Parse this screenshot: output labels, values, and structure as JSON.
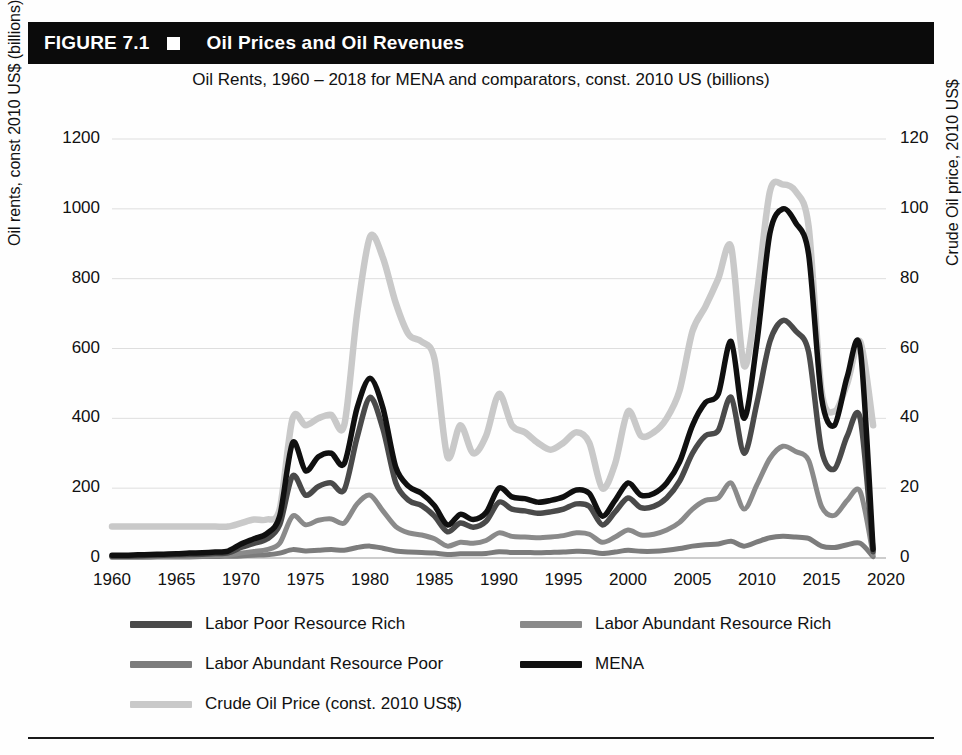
{
  "figure": {
    "number": "FIGURE 7.1",
    "title": "Oil Prices and Oil Revenues",
    "bar_color": "#0b0b0b",
    "marker_icon": "filled-square-icon"
  },
  "chart_data": {
    "type": "line",
    "title": "Oil Rents, 1960 – 2018 for MENA and comparators, const. 2010 US (billions)",
    "xlabel": "",
    "ylabel": "Oil rents, const 2010 US$ (billions)",
    "y2label": "Crude Oil price, 2010 US$",
    "xlim": [
      1960,
      2020
    ],
    "ylim": [
      0,
      1200
    ],
    "y2lim": [
      0,
      120
    ],
    "xticks": [
      1960,
      1965,
      1970,
      1975,
      1980,
      1985,
      1990,
      1995,
      2000,
      2005,
      2010,
      2015,
      2020
    ],
    "yticks": [
      0,
      200,
      400,
      600,
      800,
      1000,
      1200
    ],
    "y2ticks": [
      0,
      20,
      40,
      60,
      80,
      100,
      120
    ],
    "grid": true,
    "legend_position": "bottom",
    "x": [
      1960,
      1961,
      1962,
      1963,
      1964,
      1965,
      1966,
      1967,
      1968,
      1969,
      1970,
      1971,
      1972,
      1973,
      1974,
      1975,
      1976,
      1977,
      1978,
      1979,
      1980,
      1981,
      1982,
      1983,
      1984,
      1985,
      1986,
      1987,
      1988,
      1989,
      1990,
      1991,
      1992,
      1993,
      1994,
      1995,
      1996,
      1997,
      1998,
      1999,
      2000,
      2001,
      2002,
      2003,
      2004,
      2005,
      2006,
      2007,
      2008,
      2009,
      2010,
      2011,
      2012,
      2013,
      2014,
      2015,
      2016,
      2017,
      2018,
      2019
    ],
    "series": [
      {
        "name": "MENA",
        "axis": "left",
        "color": "#101010",
        "values": [
          8,
          8,
          9,
          10,
          11,
          12,
          14,
          15,
          17,
          20,
          40,
          55,
          70,
          120,
          330,
          250,
          290,
          300,
          270,
          430,
          515,
          430,
          260,
          205,
          185,
          150,
          95,
          125,
          110,
          130,
          200,
          175,
          170,
          160,
          165,
          175,
          195,
          185,
          120,
          165,
          215,
          180,
          185,
          215,
          275,
          380,
          445,
          470,
          620,
          400,
          620,
          930,
          1000,
          960,
          870,
          460,
          380,
          520,
          600,
          25
        ]
      },
      {
        "name": "Labor Poor Resource Rich",
        "axis": "left",
        "color": "#4a4a4a",
        "values": [
          5,
          5,
          6,
          7,
          8,
          9,
          10,
          11,
          13,
          15,
          30,
          42,
          54,
          95,
          235,
          180,
          205,
          215,
          195,
          345,
          460,
          370,
          215,
          165,
          150,
          120,
          75,
          100,
          88,
          105,
          160,
          140,
          135,
          128,
          132,
          140,
          155,
          148,
          95,
          132,
          172,
          144,
          148,
          172,
          220,
          300,
          350,
          365,
          460,
          300,
          445,
          620,
          680,
          650,
          590,
          310,
          255,
          350,
          400,
          18
        ]
      },
      {
        "name": "Labor Abundant Resource Rich",
        "axis": "left",
        "color": "#8a8a8a",
        "values": [
          3,
          3,
          3,
          4,
          4,
          5,
          5,
          6,
          7,
          8,
          14,
          19,
          24,
          42,
          120,
          95,
          108,
          112,
          100,
          155,
          180,
          135,
          90,
          72,
          66,
          55,
          34,
          45,
          42,
          50,
          72,
          62,
          60,
          58,
          60,
          64,
          72,
          68,
          45,
          60,
          80,
          66,
          68,
          80,
          102,
          140,
          165,
          172,
          215,
          140,
          210,
          285,
          320,
          305,
          280,
          148,
          122,
          165,
          190,
          10
        ]
      },
      {
        "name": "Labor Abundant Resource Poor",
        "axis": "left",
        "color": "#7c7c7c",
        "values": [
          2,
          2,
          2,
          2,
          3,
          3,
          3,
          4,
          4,
          5,
          6,
          8,
          9,
          14,
          24,
          20,
          22,
          24,
          22,
          30,
          34,
          28,
          20,
          17,
          16,
          14,
          10,
          12,
          12,
          13,
          18,
          16,
          16,
          15,
          16,
          17,
          19,
          18,
          13,
          17,
          22,
          19,
          19,
          22,
          27,
          34,
          38,
          40,
          48,
          34,
          46,
          58,
          62,
          60,
          56,
          34,
          30,
          38,
          42,
          4
        ]
      },
      {
        "name": "Crude Oil Price (const. 2010 US$)",
        "axis": "right",
        "color": "#c9c9c9",
        "values": [
          9,
          9,
          9,
          9,
          9,
          9,
          9,
          9,
          9,
          9,
          10,
          11,
          11,
          14,
          40,
          38,
          40,
          41,
          38,
          70,
          92,
          86,
          73,
          64,
          62,
          57,
          29,
          38,
          30,
          35,
          47,
          38,
          36,
          33,
          31,
          33,
          36,
          33,
          20,
          27,
          42,
          35,
          36,
          40,
          48,
          65,
          72,
          80,
          89,
          55,
          76,
          105,
          107,
          105,
          95,
          48,
          42,
          50,
          62,
          38
        ]
      }
    ],
    "annotations": {
      "peaks": [
        {
          "year": 1974,
          "series": "MENA",
          "value": 330
        },
        {
          "year": 1980,
          "series": "MENA",
          "value": 515
        },
        {
          "year": 2008,
          "series": "Crude Oil Price (const. 2010 US$)",
          "value": 89
        },
        {
          "year": 2012,
          "series": "MENA",
          "value": 1000
        },
        {
          "year": 2012,
          "series": "Crude Oil Price (const. 2010 US$)",
          "value": 107
        }
      ]
    }
  },
  "legend": {
    "items": [
      {
        "label": "Labor Poor Resource Rich",
        "color": "#4a4a4a"
      },
      {
        "label": "Labor Abundant Resource Rich",
        "color": "#8a8a8a"
      },
      {
        "label": "Labor Abundant Resource Poor",
        "color": "#7c7c7c"
      },
      {
        "label": "MENA",
        "color": "#101010"
      },
      {
        "label": "Crude Oil Price (const. 2010 US$)",
        "color": "#c9c9c9"
      }
    ]
  }
}
